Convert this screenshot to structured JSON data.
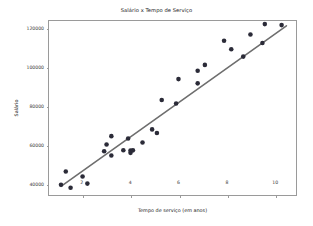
{
  "chart_data": {
    "type": "scatter",
    "title": "Salário x Tempo de Serviço",
    "xlabel": "Tempo de serviço (em anos)",
    "ylabel": "Salário",
    "grid": false,
    "legend": null,
    "xlim": [
      0.6,
      10.9
    ],
    "ylim": [
      34000,
      124000
    ],
    "xticks": [
      2,
      4,
      6,
      8,
      10
    ],
    "xticklabels": [
      "2",
      "4",
      "6",
      "8",
      "10"
    ],
    "yticks": [
      40000,
      60000,
      80000,
      100000,
      120000
    ],
    "yticklabels": [
      "40000",
      "60000",
      "80000",
      "100000",
      "120000"
    ],
    "marker_color": "#2b2b38",
    "marker_size": 2.3,
    "line_color": "#6e6e6e",
    "line_width": 1.6,
    "frame_color": "#9a9a9a",
    "background": "#ffffff",
    "series": [
      {
        "name": "Salário observado",
        "kind": "scatter",
        "points": [
          [
            1.1,
            39343
          ],
          [
            1.3,
            46205
          ],
          [
            1.5,
            37731
          ],
          [
            2.0,
            43525
          ],
          [
            2.2,
            39891
          ],
          [
            2.9,
            56642
          ],
          [
            3.0,
            60150
          ],
          [
            3.2,
            54445
          ],
          [
            3.2,
            64445
          ],
          [
            3.7,
            57189
          ],
          [
            3.9,
            63218
          ],
          [
            4.0,
            55794
          ],
          [
            4.0,
            56957
          ],
          [
            4.1,
            57081
          ],
          [
            4.5,
            61111
          ],
          [
            4.9,
            67938
          ],
          [
            5.1,
            66029
          ],
          [
            5.3,
            83088
          ],
          [
            5.9,
            81363
          ],
          [
            6.0,
            93940
          ],
          [
            6.8,
            91738
          ],
          [
            6.8,
            98273
          ],
          [
            7.1,
            101302
          ],
          [
            7.9,
            113812
          ],
          [
            8.2,
            109431
          ],
          [
            8.7,
            105582
          ],
          [
            9.0,
            116969
          ],
          [
            9.5,
            112635
          ],
          [
            9.6,
            122391
          ],
          [
            10.3,
            121872
          ]
        ]
      },
      {
        "name": "Reta de regressão",
        "kind": "line",
        "points": [
          [
            1.1,
            38500
          ],
          [
            10.5,
            121500
          ]
        ]
      }
    ]
  }
}
